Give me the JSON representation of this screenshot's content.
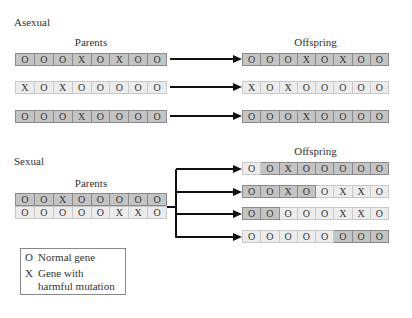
{
  "colors": {
    "dark_cell": "#c4c4c4",
    "light_cell": "#ececec",
    "arrow": "#111111"
  },
  "asexual": {
    "title": "Asexual",
    "parents_label": "Parents",
    "offspring_label": "Offspring",
    "parents": [
      {
        "shade": "dark",
        "genes": [
          "O",
          "O",
          "O",
          "X",
          "O",
          "X",
          "O",
          "O"
        ]
      },
      {
        "shade": "light",
        "genes": [
          "X",
          "O",
          "X",
          "O",
          "O",
          "O",
          "O",
          "O"
        ]
      },
      {
        "shade": "dark",
        "genes": [
          "O",
          "O",
          "O",
          "X",
          "O",
          "O",
          "O",
          "O"
        ]
      }
    ],
    "offspring": [
      {
        "shade": "dark",
        "genes": [
          "O",
          "O",
          "O",
          "X",
          "O",
          "X",
          "O",
          "O"
        ]
      },
      {
        "shade": "light",
        "genes": [
          "X",
          "O",
          "X",
          "O",
          "O",
          "O",
          "O",
          "O"
        ]
      },
      {
        "shade": "dark",
        "genes": [
          "O",
          "O",
          "O",
          "X",
          "O",
          "O",
          "O",
          "O"
        ]
      }
    ]
  },
  "sexual": {
    "title": "Sexual",
    "parents_label": "Parents",
    "offspring_label": "Offspring",
    "parents": [
      {
        "shade": "dark",
        "genes": [
          "O",
          "O",
          "X",
          "O",
          "O",
          "O",
          "O",
          "O"
        ]
      },
      {
        "shade": "light",
        "genes": [
          "O",
          "O",
          "O",
          "O",
          "O",
          "X",
          "X",
          "O"
        ]
      }
    ],
    "offspring": [
      {
        "genes": [
          "O",
          "O",
          "X",
          "O",
          "O",
          "O",
          "O",
          "O"
        ],
        "shades": [
          "light",
          "dark",
          "dark",
          "dark",
          "dark",
          "dark",
          "dark",
          "dark"
        ]
      },
      {
        "genes": [
          "O",
          "O",
          "X",
          "O",
          "O",
          "X",
          "X",
          "O"
        ],
        "shades": [
          "dark",
          "dark",
          "dark",
          "dark",
          "light",
          "light",
          "light",
          "light"
        ]
      },
      {
        "genes": [
          "O",
          "O",
          "O",
          "O",
          "O",
          "X",
          "X",
          "O"
        ],
        "shades": [
          "dark",
          "dark",
          "light",
          "light",
          "light",
          "light",
          "light",
          "light"
        ]
      },
      {
        "genes": [
          "O",
          "O",
          "O",
          "O",
          "O",
          "O",
          "O",
          "O"
        ],
        "shades": [
          "light",
          "light",
          "light",
          "light",
          "light",
          "dark",
          "dark",
          "dark"
        ]
      }
    ]
  },
  "legend": {
    "items": [
      {
        "symbol": "O",
        "label": "Normal gene"
      },
      {
        "symbol": "X",
        "label": "Gene with harmful mutation"
      }
    ]
  }
}
